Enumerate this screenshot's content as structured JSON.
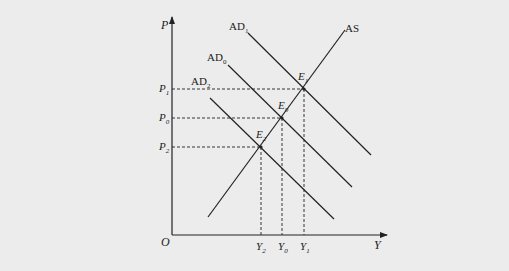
{
  "diagram": {
    "type": "AD-AS macroeconomic equilibrium",
    "axes": {
      "y_label": "P",
      "x_label": "Y",
      "origin_label": "O"
    },
    "curves": [
      {
        "id": "AS",
        "label": "AS",
        "kind": "aggregate-supply"
      },
      {
        "id": "AD1",
        "label": "AD",
        "subscript": "1",
        "kind": "aggregate-demand"
      },
      {
        "id": "AD0",
        "label": "AD",
        "subscript": "0",
        "kind": "aggregate-demand"
      },
      {
        "id": "AD2",
        "label": "AD",
        "subscript": "2",
        "kind": "aggregate-demand"
      }
    ],
    "equilibria": [
      {
        "label": "E",
        "subscript": "1",
        "price": "P1",
        "output": "Y1"
      },
      {
        "label": "E",
        "subscript": "0",
        "price": "P0",
        "output": "Y0"
      },
      {
        "label": "E",
        "subscript": "2",
        "price": "P2",
        "output": "Y2"
      }
    ],
    "price_ticks": [
      {
        "label": "P",
        "subscript": "1"
      },
      {
        "label": "P",
        "subscript": "0"
      },
      {
        "label": "P",
        "subscript": "2"
      }
    ],
    "output_ticks": [
      {
        "label": "Y",
        "subscript": "2"
      },
      {
        "label": "Y",
        "subscript": "0"
      },
      {
        "label": "Y",
        "subscript": "1"
      }
    ]
  },
  "colors": {
    "paper": "#ececec",
    "ink": "#222222",
    "bleed_text": "#d6d6d6"
  }
}
